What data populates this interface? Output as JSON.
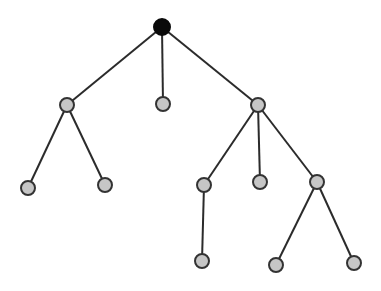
{
  "diagram": {
    "type": "tree",
    "colors": {
      "background": "#ffffff",
      "edge": "#2b2b2b",
      "root_fill": "#0a0a0a",
      "node_fill": "#c6c6c6",
      "node_stroke": "#333333"
    },
    "node_radius": 7,
    "root_radius": 8,
    "nodes": [
      {
        "id": "root",
        "x": 162,
        "y": 27,
        "root": true
      },
      {
        "id": "a",
        "x": 67,
        "y": 105
      },
      {
        "id": "b",
        "x": 163,
        "y": 104
      },
      {
        "id": "c",
        "x": 258,
        "y": 105
      },
      {
        "id": "a1",
        "x": 28,
        "y": 188
      },
      {
        "id": "a2",
        "x": 105,
        "y": 185
      },
      {
        "id": "c1",
        "x": 204,
        "y": 185
      },
      {
        "id": "c2",
        "x": 260,
        "y": 182
      },
      {
        "id": "c3",
        "x": 317,
        "y": 182
      },
      {
        "id": "c1a",
        "x": 202,
        "y": 261
      },
      {
        "id": "c3a",
        "x": 276,
        "y": 265
      },
      {
        "id": "c3b",
        "x": 354,
        "y": 263
      }
    ],
    "edges": [
      [
        "root",
        "a"
      ],
      [
        "root",
        "b"
      ],
      [
        "root",
        "c"
      ],
      [
        "a",
        "a1"
      ],
      [
        "a",
        "a2"
      ],
      [
        "c",
        "c1"
      ],
      [
        "c",
        "c2"
      ],
      [
        "c",
        "c3"
      ],
      [
        "c1",
        "c1a"
      ],
      [
        "c3",
        "c3a"
      ],
      [
        "c3",
        "c3b"
      ]
    ]
  }
}
